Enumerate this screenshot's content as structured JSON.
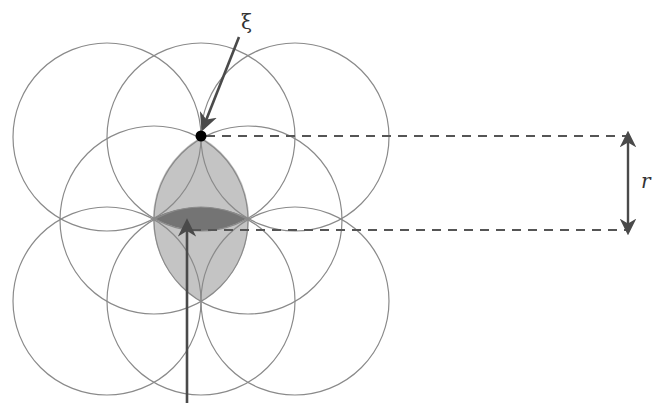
{
  "diagram": {
    "type": "overlapping-circles-coverage",
    "labels": {
      "xi": "ξ",
      "r": "r"
    },
    "colors": {
      "circle_stroke": "#8a8a8a",
      "lens_fill": "#c4c4c4",
      "dark_region_fill": "#707070",
      "arrow": "#4a4a4a",
      "dashed_line": "#555555",
      "point": "#000000"
    },
    "circle_radius": 94,
    "circles": [
      {
        "id": "top-left",
        "cx": 107,
        "cy": 137
      },
      {
        "id": "top-middle",
        "cx": 201,
        "cy": 137
      },
      {
        "id": "top-right",
        "cx": 295,
        "cy": 137
      },
      {
        "id": "middle-left",
        "cx": 154,
        "cy": 220
      },
      {
        "id": "middle-right",
        "cx": 248,
        "cy": 220
      },
      {
        "id": "bottom-left",
        "cx": 107,
        "cy": 301
      },
      {
        "id": "bottom-middle",
        "cx": 201,
        "cy": 301
      },
      {
        "id": "bottom-right",
        "cx": 295,
        "cy": 301
      }
    ],
    "point_xi": {
      "x": 201,
      "y": 136
    },
    "dimension": {
      "from_y": 136,
      "to_y": 230,
      "x": 628,
      "label": "r"
    }
  }
}
